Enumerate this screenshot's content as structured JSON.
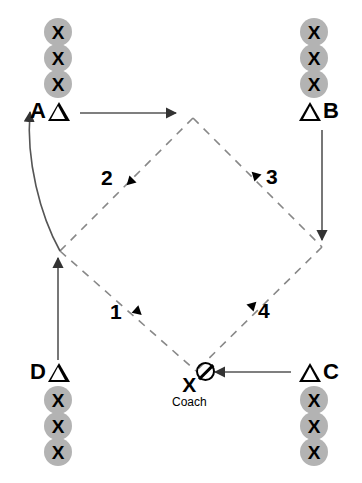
{
  "diagram": {
    "type": "sports-drill-diagram",
    "colors": {
      "player_circle": "#b3b3b3",
      "line": "#555555",
      "ink": "#000000",
      "background": "#ffffff"
    },
    "stations": [
      {
        "id": "A",
        "label": "A",
        "marker": "triangle",
        "marker_side": "right",
        "players": [
          "X",
          "X",
          "X"
        ]
      },
      {
        "id": "B",
        "label": "B",
        "marker": "triangle",
        "marker_side": "left",
        "players": [
          "X",
          "X",
          "X"
        ]
      },
      {
        "id": "C",
        "label": "C",
        "marker": "triangle",
        "marker_side": "left",
        "players": [
          "X",
          "X",
          "X"
        ]
      },
      {
        "id": "D",
        "label": "D",
        "marker": "triangle",
        "marker_side": "right",
        "players": [
          "X",
          "X",
          "X"
        ]
      }
    ],
    "path_numbers": [
      {
        "id": "1",
        "label": "1"
      },
      {
        "id": "2",
        "label": "2"
      },
      {
        "id": "3",
        "label": "3"
      },
      {
        "id": "4",
        "label": "4"
      }
    ],
    "coach": {
      "marker": "X",
      "label": "Coach",
      "ball": "ball-icon"
    }
  }
}
